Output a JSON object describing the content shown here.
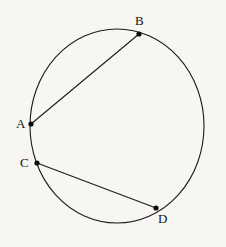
{
  "figure": {
    "background_color": "#f7f6f3",
    "stroke_color": "#1b1b1b",
    "label_color": "#131313",
    "width": 226,
    "height": 247,
    "circle": {
      "center_x": 117,
      "center_y": 126,
      "radius_x": 87,
      "radius_y": 97
    },
    "points": [
      {
        "id": "A",
        "label": "A",
        "x": 31,
        "y": 124,
        "label_x": 16,
        "label_y": 117
      },
      {
        "id": "B",
        "label": "B",
        "x": 139,
        "y": 34,
        "label_x": 135,
        "label_y": 14
      },
      {
        "id": "C",
        "label": "C",
        "x": 37,
        "y": 163,
        "label_x": 20,
        "label_y": 156
      },
      {
        "id": "D",
        "label": "D",
        "x": 156,
        "y": 208,
        "label_x": 158,
        "label_y": 212
      }
    ],
    "chords": [
      {
        "id": "AB",
        "from": "A",
        "to": "B",
        "x1": 31,
        "y1": 124,
        "x2": 139,
        "y2": 34
      },
      {
        "id": "CD",
        "from": "C",
        "to": "D",
        "x1": 37,
        "y1": 163,
        "x2": 156,
        "y2": 208
      }
    ],
    "dot_radius": 2.6
  }
}
